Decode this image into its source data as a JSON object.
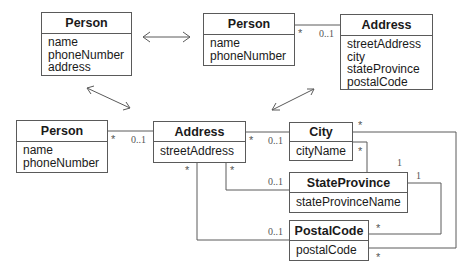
{
  "diagram": {
    "classes": [
      {
        "id": "person-1",
        "name": "Person",
        "attributes": [
          "name",
          "phoneNumber",
          "address"
        ]
      },
      {
        "id": "person-2",
        "name": "Person",
        "attributes": [
          "name",
          "phoneNumber"
        ]
      },
      {
        "id": "address-1",
        "name": "Address",
        "attributes": [
          "streetAddress",
          "city",
          "stateProvince",
          "postalCode"
        ]
      },
      {
        "id": "person-3",
        "name": "Person",
        "attributes": [
          "name",
          "phoneNumber"
        ]
      },
      {
        "id": "address-2",
        "name": "Address",
        "attributes": [
          "streetAddress"
        ]
      },
      {
        "id": "city",
        "name": "City",
        "attributes": [
          "cityName"
        ]
      },
      {
        "id": "state-province",
        "name": "StateProvince",
        "attributes": [
          "stateProvinceName"
        ]
      },
      {
        "id": "postal-code",
        "name": "PostalCode",
        "attributes": [
          "postalCode"
        ]
      }
    ],
    "multiplicities": {
      "p2_a1_star": "*",
      "p2_a1_opt": "0..1",
      "p3_a2_star": "*",
      "p3_a2_opt": "0..1",
      "a2_city_star": "*",
      "a2_city_opt": "0..1",
      "a2_sp_star": "*",
      "a2_sp_opt": "0..1",
      "a2_pc_star": "*",
      "a2_pc_opt": "0..1",
      "city_sp_star": "*",
      "city_sp_one": "1",
      "city_pc_star": "*",
      "sp_pc_one": "1",
      "sp_pc_star": "*",
      "pc_city_star": "*"
    },
    "colors": {
      "line": "#5a5a5a",
      "text": "#1a1a1a"
    }
  }
}
